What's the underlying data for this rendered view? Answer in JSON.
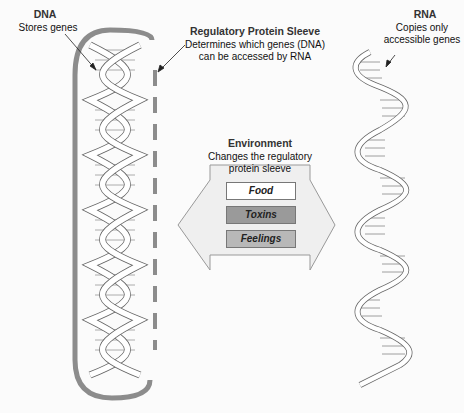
{
  "dna": {
    "title": "DNA",
    "caption": "Stores genes"
  },
  "sleeve": {
    "title": "Regulatory Protein Sleeve",
    "caption_line1": "Determines which genes (DNA)",
    "caption_line2": "can be accessed by RNA"
  },
  "rna": {
    "title": "RNA",
    "caption_line1": "Copies only",
    "caption_line2": "accessible genes"
  },
  "environment": {
    "title": "Environment",
    "caption_line1": "Changes the regulatory",
    "caption_line2": "protein sleeve",
    "factors": [
      {
        "label": "Food",
        "fill": "#ffffff"
      },
      {
        "label": "Toxins",
        "fill": "#9a9a9a"
      },
      {
        "label": "Feelings",
        "fill": "#b8b8b8"
      }
    ]
  },
  "colors": {
    "sleeve": "#8c8c8c",
    "arrow_fill": "#efefef",
    "arrow_stroke": "#999999"
  }
}
